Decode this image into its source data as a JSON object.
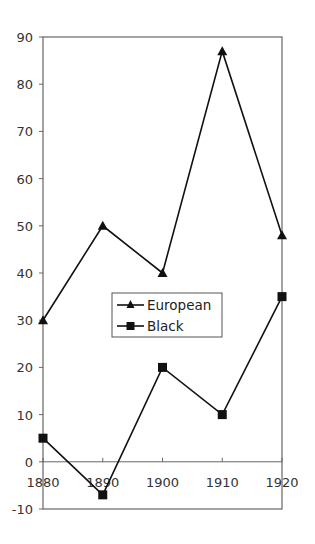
{
  "chart_data": {
    "type": "line",
    "title": "",
    "xlabel": "",
    "ylabel": "",
    "categories": [
      "1880",
      "1890",
      "1900",
      "1910",
      "1920"
    ],
    "series": [
      {
        "name": "European",
        "marker": "triangle",
        "values": [
          30,
          50,
          40,
          87,
          48
        ]
      },
      {
        "name": "Black",
        "marker": "square",
        "values": [
          5,
          -7,
          20,
          10,
          35
        ]
      }
    ],
    "ylim": [
      -10,
      90
    ],
    "yticks": [
      -10,
      0,
      10,
      20,
      30,
      40,
      50,
      60,
      70,
      80,
      90
    ],
    "grid": false,
    "legend_position": "center",
    "line_color": "#111111"
  },
  "legend": {
    "items": [
      {
        "label": "European"
      },
      {
        "label": "Black"
      }
    ]
  }
}
